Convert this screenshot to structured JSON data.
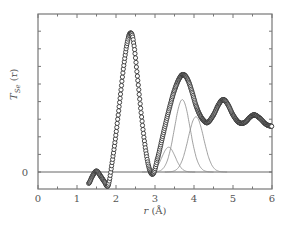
{
  "chart_data": {
    "type": "line",
    "title": "",
    "xlabel": "r (Å)",
    "ylabel": "T_Se (r)",
    "xlim": [
      0,
      6
    ],
    "x_ticks": [
      "0",
      "1",
      "2",
      "3",
      "4",
      "5",
      "6"
    ],
    "y_ticks": [
      "0"
    ],
    "grid": false,
    "legend": null,
    "series": [
      {
        "name": "Measured T_Se(r) (circles)",
        "style": "open circles, thick",
        "x": [
          1.3,
          1.4,
          1.5,
          1.6,
          1.7,
          1.8,
          1.9,
          2.0,
          2.1,
          2.2,
          2.3,
          2.38,
          2.45,
          2.55,
          2.65,
          2.75,
          2.85,
          2.95,
          3.05,
          3.2,
          3.35,
          3.5,
          3.65,
          3.75,
          3.85,
          3.95,
          4.05,
          4.15,
          4.25,
          4.35,
          4.5,
          4.65,
          4.75,
          4.85,
          5.0,
          5.15,
          5.3,
          5.45,
          5.55,
          5.7,
          5.85,
          6.0
        ],
        "values": [
          -0.6,
          -0.2,
          0.05,
          -0.2,
          -0.5,
          -0.7,
          0.5,
          2.0,
          3.8,
          5.6,
          6.9,
          7.3,
          6.8,
          5.0,
          3.0,
          1.3,
          0.2,
          -0.1,
          0.6,
          1.9,
          3.2,
          4.3,
          5.0,
          5.1,
          4.8,
          4.2,
          3.5,
          3.0,
          2.7,
          2.6,
          3.0,
          3.6,
          3.8,
          3.6,
          3.0,
          2.6,
          2.6,
          2.9,
          3.0,
          2.8,
          2.5,
          2.4
        ]
      },
      {
        "name": "Gaussian component 1",
        "style": "thin line",
        "center": 3.35,
        "height": 1.3,
        "sigma": 0.17
      },
      {
        "name": "Gaussian component 2",
        "style": "thin line",
        "center": 3.7,
        "height": 3.8,
        "sigma": 0.2
      },
      {
        "name": "Gaussian component 3",
        "style": "thin line",
        "center": 4.05,
        "height": 2.9,
        "sigma": 0.2
      }
    ],
    "annotations": [
      "horizontal zero line at T_Se(r)=0"
    ]
  },
  "labels": {
    "xlabel": "r (Å)",
    "ylabel_main": "T",
    "ylabel_sub": "Se",
    "ylabel_arg": " (r)",
    "zero": "0"
  }
}
